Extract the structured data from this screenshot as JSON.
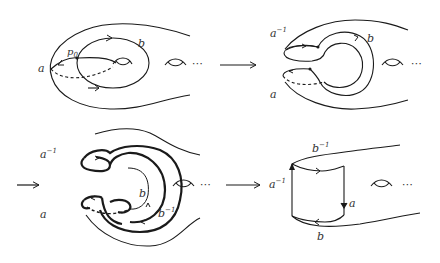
{
  "figure": {
    "stroke_color": "#1a1a1a",
    "label_color": "#333333",
    "panels": [
      {
        "id": "panel-1",
        "labels": {
          "a": "a",
          "b": "b",
          "p0_base": "p",
          "p0_sub": "0",
          "ellipsis": "⋯"
        }
      },
      {
        "id": "panel-2",
        "labels": {
          "a_inv_base": "a",
          "a_inv_sup": "−1",
          "a": "a",
          "b": "b",
          "ellipsis": "⋯"
        }
      },
      {
        "id": "panel-3",
        "labels": {
          "a_inv_base": "a",
          "a_inv_sup": "−1",
          "a": "a",
          "b": "b",
          "b_inv_base": "b",
          "b_inv_sup": "−1",
          "ellipsis": "⋯"
        }
      },
      {
        "id": "panel-4",
        "labels": {
          "b_inv_base": "b",
          "b_inv_sup": "−1",
          "a_inv_base": "a",
          "a_inv_sup": "−1",
          "a": "a",
          "b": "b",
          "ellipsis": "⋯"
        }
      }
    ],
    "transition_arrows": [
      "panel-1 to panel-2",
      "panel-2 to panel-3",
      "panel-3 to panel-4"
    ]
  }
}
